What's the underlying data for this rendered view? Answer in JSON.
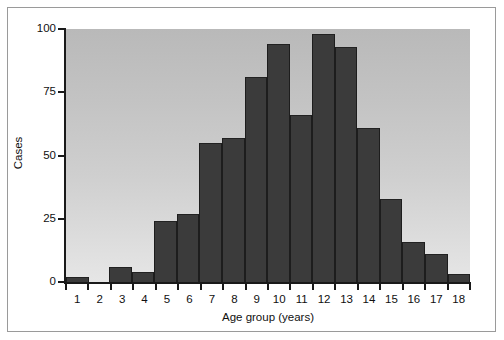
{
  "chart_data": {
    "type": "bar",
    "title": "",
    "subtitle": "",
    "xlabel": "Age group (years)",
    "ylabel": "Cases",
    "categories": [
      "1",
      "2",
      "3",
      "4",
      "5",
      "6",
      "7",
      "8",
      "9",
      "10",
      "11",
      "12",
      "13",
      "14",
      "15",
      "16",
      "17",
      "18"
    ],
    "values": [
      2,
      0,
      6,
      4,
      24,
      27,
      55,
      57,
      81,
      94,
      66,
      98,
      93,
      61,
      33,
      16,
      11,
      3
    ],
    "series": [
      {
        "name": "Cases",
        "values": [
          2,
          0,
          6,
          4,
          24,
          27,
          55,
          57,
          81,
          94,
          66,
          98,
          93,
          61,
          33,
          16,
          11,
          3
        ]
      }
    ],
    "ylim": [
      0,
      100
    ],
    "xlim": [
      0.5,
      18.5
    ],
    "y_ticks": [
      "0",
      "25",
      "50",
      "75",
      "100"
    ],
    "y_tick_values": [
      0,
      25,
      50,
      75,
      100
    ],
    "grid": false,
    "legend": false,
    "legend_position": "none",
    "bar_color": "#3b3b3b",
    "bar_edge_color": "#1d1d1d",
    "plot_background_top": "#b9b9b9",
    "plot_background_bottom": "#e6e6e6",
    "axis_color": "#1a1a1a",
    "frame_color": "#9a9a9a",
    "figure_background": "#ffffff"
  }
}
